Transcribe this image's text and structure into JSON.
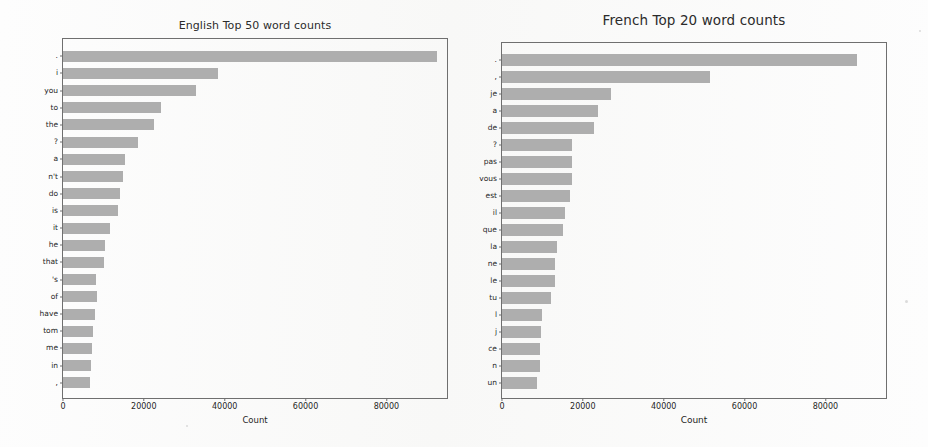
{
  "figure": {
    "background_color": "#fdfdfd",
    "bar_color": "#aeaeae",
    "axis_color": "#6f6f6f",
    "text_color": "#1f1f1f"
  },
  "panels": [
    {
      "id": "english",
      "title": "English Top 50 word counts",
      "xlabel": "Count",
      "xticks": [
        "0",
        "20000",
        "40000",
        "60000",
        "80000"
      ]
    },
    {
      "id": "french",
      "title": "French Top 20 word counts",
      "xlabel": "Count",
      "xticks": [
        "0",
        "20000",
        "40000",
        "60000",
        "80000"
      ]
    }
  ],
  "chart_data": [
    {
      "type": "bar",
      "orientation": "horizontal",
      "title": "English Top 50 word counts",
      "xlabel": "Count",
      "ylabel": "",
      "xlim": [
        0,
        95000
      ],
      "xticks": [
        0,
        20000,
        40000,
        60000,
        80000
      ],
      "grid": false,
      "legend": false,
      "categories": [
        ".",
        "i",
        "you",
        "to",
        "the",
        "?",
        "a",
        "n't",
        "do",
        "is",
        "it",
        "he",
        "that",
        "'s",
        "of",
        "have",
        "tom",
        "me",
        "in",
        ","
      ],
      "values": [
        92600,
        38300,
        33000,
        24200,
        22500,
        18500,
        15300,
        14800,
        14100,
        13600,
        11600,
        10400,
        10100,
        8100,
        8400,
        7900,
        7400,
        7200,
        6900,
        6700
      ]
    },
    {
      "type": "bar",
      "orientation": "horizontal",
      "title": "French Top 20 word counts",
      "xlabel": "Count",
      "ylabel": "",
      "xlim": [
        0,
        95000
      ],
      "xticks": [
        0,
        20000,
        40000,
        60000,
        80000
      ],
      "grid": false,
      "legend": false,
      "categories": [
        ".",
        ",",
        "je",
        "a",
        "de",
        "?",
        "pas",
        "vous",
        "est",
        "il",
        "que",
        "la",
        "ne",
        "le",
        "tu",
        "l",
        "j",
        "ce",
        "n",
        "un"
      ],
      "values": [
        87800,
        51400,
        27000,
        23700,
        22800,
        17400,
        17300,
        17300,
        16700,
        15700,
        15100,
        13600,
        13100,
        13000,
        12000,
        9900,
        9700,
        9500,
        9400,
        8700
      ]
    }
  ]
}
